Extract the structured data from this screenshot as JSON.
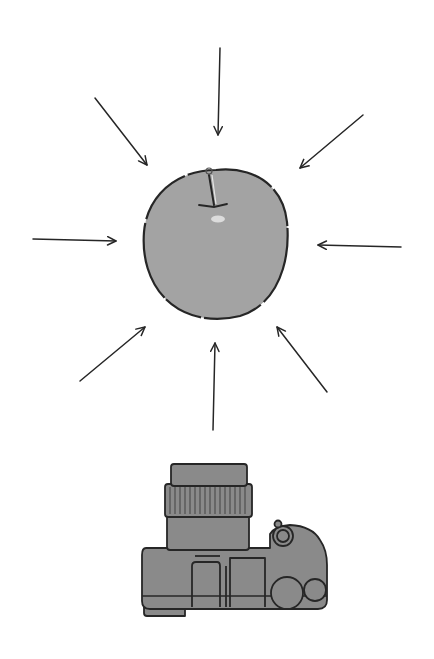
{
  "illustration": {
    "subject": "apple",
    "device": "camera",
    "arrow_count": 8,
    "colors": {
      "background": "#ffffff",
      "apple_fill": "#a3a3a3",
      "camera_fill": "#8a8a8a",
      "outline": "#262626",
      "highlight": "#dcdcdc"
    },
    "arrows": [
      {
        "name": "top",
        "x1": 220,
        "y1": 48,
        "x2": 218,
        "y2": 135
      },
      {
        "name": "top-left",
        "x1": 95,
        "y1": 98,
        "x2": 147,
        "y2": 165
      },
      {
        "name": "top-right",
        "x1": 363,
        "y1": 115,
        "x2": 300,
        "y2": 168
      },
      {
        "name": "left",
        "x1": 33,
        "y1": 239,
        "x2": 116,
        "y2": 241
      },
      {
        "name": "right",
        "x1": 401,
        "y1": 247,
        "x2": 318,
        "y2": 245
      },
      {
        "name": "bottom-left",
        "x1": 80,
        "y1": 381,
        "x2": 145,
        "y2": 327
      },
      {
        "name": "bottom",
        "x1": 213,
        "y1": 430,
        "x2": 215,
        "y2": 343
      },
      {
        "name": "bottom-right",
        "x1": 327,
        "y1": 392,
        "x2": 277,
        "y2": 327
      }
    ]
  }
}
